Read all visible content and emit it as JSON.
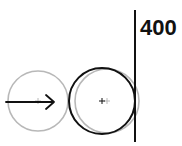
{
  "diagram": {
    "wall_label": "400",
    "colors": {
      "ghost": "#b8b8b8",
      "solid": "#111111",
      "background": "#ffffff"
    },
    "elements": [
      {
        "type": "ghost-circle",
        "label": "ball-start-position"
      },
      {
        "type": "velocity-arrow",
        "direction": "right"
      },
      {
        "type": "solid-circle",
        "label": "ball-current-position"
      },
      {
        "type": "ghost-circle",
        "label": "ball-overlap-position"
      },
      {
        "type": "wall-line",
        "x_value": "400"
      }
    ]
  }
}
